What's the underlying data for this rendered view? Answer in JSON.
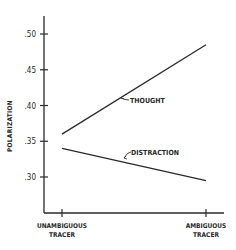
{
  "chart_data": {
    "type": "line",
    "title": "",
    "xlabel": "",
    "ylabel": "POLARIZATION",
    "categories": [
      "UNAMBIGUOUS TRACER",
      "AMBIGUOUS TRACER"
    ],
    "category_lines": [
      [
        "UNAMBIGUOUS",
        "TRACER"
      ],
      [
        "AMBIGUOUS",
        "TRACER"
      ]
    ],
    "series": [
      {
        "name": "THOUGHT",
        "values": [
          0.36,
          0.485
        ]
      },
      {
        "name": "DISTRACTION",
        "values": [
          0.34,
          0.295
        ]
      }
    ],
    "yticks": [
      0.3,
      0.35,
      0.4,
      0.45,
      0.5
    ],
    "ytick_labels": [
      ".30",
      ".35",
      ".40",
      ".45",
      ".50"
    ],
    "ylim": [
      0.25,
      0.525
    ],
    "grid": false,
    "legend": "inline labels with arrows",
    "line_color": "#2a2a2a"
  }
}
